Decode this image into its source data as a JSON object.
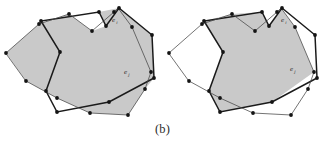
{
  "figure": {
    "caption": "(b)",
    "colors": {
      "shaded_region": "#c9c9c9",
      "thick_edge": "#1a1a1a",
      "thin_edge": "#454545",
      "vertex": "#141414",
      "background": "#ffffff",
      "label_text": "#2a2a2a"
    },
    "panels": [
      {
        "id": "left-panel",
        "name": "union-of-two-polygons",
        "shaded": "union",
        "labels": [
          {
            "id": "label-ei-left",
            "base": "e",
            "subscript": "i",
            "x": 112,
            "y": 22
          },
          {
            "id": "label-ej-left",
            "base": "e",
            "subscript": "j",
            "x": 124,
            "y": 74
          }
        ]
      },
      {
        "id": "right-panel",
        "name": "intersection-of-two-polygons",
        "shaded": "intersection",
        "labels": [
          {
            "id": "label-ei-right",
            "base": "e",
            "subscript": "i",
            "x": 281,
            "y": 22
          },
          {
            "id": "label-ej-right",
            "base": "e",
            "subscript": "j",
            "x": 293,
            "y": 71
          }
        ]
      }
    ],
    "geometry": {
      "left": {
        "polygon_a": {
          "name": "left-polygon-a",
          "points": "41,21 60,52 46,91 57,112 109,102 154,78 152,35 119,8 106,26 99,12"
        },
        "polygon_b": {
          "name": "left-polygon-b",
          "points": "6,53 39,24 69,14 92,31 114,12 118,8 132,27 151,72 145,89 128,115 90,113 57,98 26,81"
        },
        "union_outline": {
          "name": "left-union-outline",
          "points": "6,53 39,24 69,14 92,31 106,26 99,12 119,8 152,35 154,78 145,89 128,115 90,113 57,98 26,81"
        },
        "vertices_a": [
          [
            41,
            21
          ],
          [
            60,
            52
          ],
          [
            46,
            91
          ],
          [
            57,
            112
          ],
          [
            109,
            102
          ],
          [
            154,
            78
          ],
          [
            152,
            35
          ],
          [
            119,
            8
          ],
          [
            106,
            26
          ],
          [
            99,
            12
          ]
        ],
        "vertices_b": [
          [
            6,
            53
          ],
          [
            39,
            24
          ],
          [
            69,
            14
          ],
          [
            92,
            31
          ],
          [
            114,
            12
          ],
          [
            132,
            27
          ],
          [
            151,
            72
          ],
          [
            145,
            89
          ],
          [
            128,
            115
          ],
          [
            90,
            113
          ],
          [
            57,
            98
          ],
          [
            26,
            81
          ]
        ]
      },
      "right": {
        "polygon_a": {
          "name": "right-polygon-a",
          "points": "204,21 223,52 209,91 220,112 272,102 317,78 315,35 282,8 269,26 262,12"
        },
        "polygon_b": {
          "name": "right-polygon-b",
          "points": "169,53 202,24 232,14 255,31 277,12 281,8 295,27 314,72 308,89 291,115 253,113 220,98 189,81"
        },
        "intersection_outline": {
          "name": "right-intersection-outline",
          "points": "204,21 223,52 209,91 220,112 272,102 314,72 295,27 281,8 269,26 262,12 232,14"
        },
        "vertices_a": [
          [
            204,
            21
          ],
          [
            223,
            52
          ],
          [
            209,
            91
          ],
          [
            220,
            112
          ],
          [
            272,
            102
          ],
          [
            317,
            78
          ],
          [
            315,
            35
          ],
          [
            282,
            8
          ],
          [
            269,
            26
          ],
          [
            262,
            12
          ]
        ],
        "vertices_b": [
          [
            169,
            53
          ],
          [
            202,
            24
          ],
          [
            232,
            14
          ],
          [
            255,
            31
          ],
          [
            277,
            12
          ],
          [
            295,
            27
          ],
          [
            314,
            72
          ],
          [
            308,
            89
          ],
          [
            291,
            115
          ],
          [
            253,
            113
          ],
          [
            220,
            98
          ],
          [
            189,
            81
          ]
        ]
      }
    }
  }
}
